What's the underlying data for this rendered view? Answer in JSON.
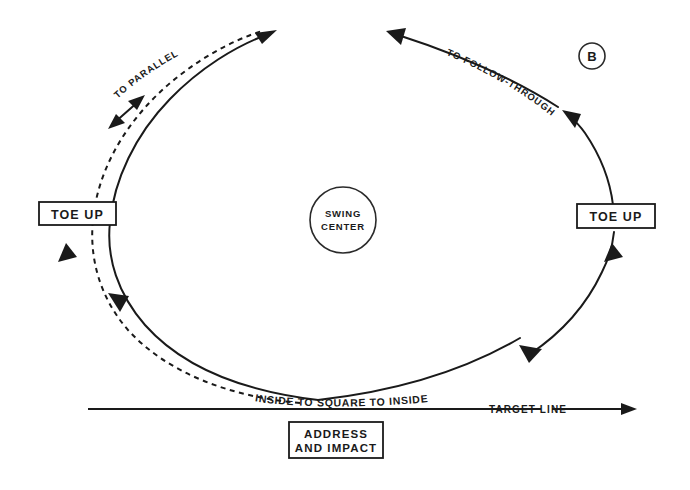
{
  "figure": {
    "panel_letter": "B",
    "title_kind": "golf-swing-plane-diagram"
  },
  "center_marker": {
    "line1": "SWING",
    "line2": "CENTER"
  },
  "boxes": [
    {
      "id": "toe-up-left",
      "label": "TOE UP"
    },
    {
      "id": "toe-up-right",
      "label": "TOE UP"
    },
    {
      "id": "address-impact",
      "line1": "ADDRESS",
      "line2": "AND IMPACT"
    }
  ],
  "curve_labels": {
    "backswing": "TO PARALLEL",
    "followthrough": "TO FOLLOW-THROUGH",
    "swing_path": "INSIDE TO SQUARE TO INSIDE"
  },
  "target_line": {
    "label": "TARGET LINE"
  },
  "colors": {
    "ink": "#1a1a1a",
    "paper": "#ffffff"
  },
  "geometry": {
    "width": 690,
    "height": 490,
    "swing_center": {
      "cx": 343,
      "cy": 220,
      "r": 33
    },
    "panel_letter_circle": {
      "cx": 592,
      "cy": 56,
      "r": 13
    },
    "target_line_y": 409,
    "target_line_x_start": 88,
    "target_line_x_end": 637
  }
}
